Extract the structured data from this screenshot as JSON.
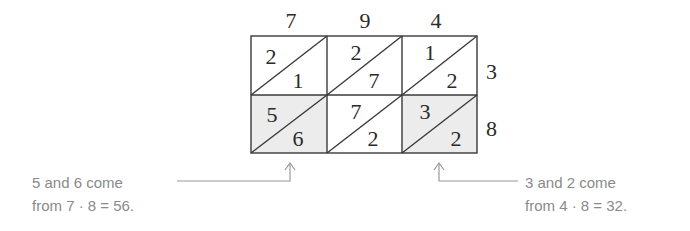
{
  "diagram": {
    "top_digits": [
      "7",
      "9",
      "4"
    ],
    "right_digits": [
      "3",
      "8"
    ],
    "cells": [
      [
        {
          "tens": "2",
          "ones": "1",
          "shaded": false
        },
        {
          "tens": "2",
          "ones": "7",
          "shaded": false
        },
        {
          "tens": "1",
          "ones": "2",
          "shaded": false
        }
      ],
      [
        {
          "tens": "5",
          "ones": "6",
          "shaded": true
        },
        {
          "tens": "7",
          "ones": "2",
          "shaded": false
        },
        {
          "tens": "3",
          "ones": "2",
          "shaded": true
        }
      ]
    ],
    "colors": {
      "grid_line": "#3a3a3a",
      "digit": "#2a2a2a",
      "shade": "#ececec",
      "annotation_text": "#8a8a8a",
      "annotation_line": "#9a9a9a"
    }
  },
  "annotations": {
    "left": {
      "line1": "5 and 6 come",
      "line2": "from 7 · 8 = 56."
    },
    "right": {
      "line1": "3 and 2 come",
      "line2": "from 4 · 8 = 32."
    }
  }
}
